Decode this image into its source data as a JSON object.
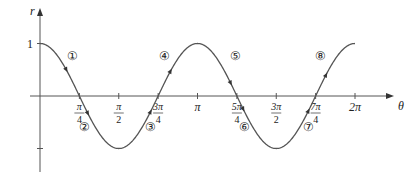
{
  "chart_data": {
    "type": "line",
    "title": "",
    "function": "r = cos(2θ)",
    "xlabel": "θ",
    "ylabel": "r",
    "xlim": [
      0,
      6.2832
    ],
    "ylim": [
      -1,
      1
    ],
    "x_ticks": [
      {
        "value": 0.7854,
        "num": "π",
        "den": "4"
      },
      {
        "value": 1.5708,
        "num": "π",
        "den": "2"
      },
      {
        "value": 2.3562,
        "num": "3π",
        "den": "4"
      },
      {
        "value": 3.1416,
        "label": "π"
      },
      {
        "value": 3.927,
        "num": "5π",
        "den": "4"
      },
      {
        "value": 4.7124,
        "num": "3π",
        "den": "2"
      },
      {
        "value": 5.4978,
        "num": "7π",
        "den": "4"
      },
      {
        "value": 6.2832,
        "label": "2π"
      }
    ],
    "y_ticks": [
      {
        "value": 1,
        "label": "1"
      },
      {
        "value": -1,
        "label": ""
      }
    ],
    "x": [
      0,
      0.7854,
      1.5708,
      2.3562,
      3.1416,
      3.927,
      4.7124,
      5.4978,
      6.2832
    ],
    "series": [
      {
        "name": "cos(2θ)",
        "values": [
          1,
          0,
          -1,
          0,
          1,
          0,
          -1,
          0,
          1
        ],
        "color": "#555555"
      }
    ],
    "annotations": [
      {
        "label": "①",
        "theta": 0.52,
        "r": 0.72
      },
      {
        "label": "②",
        "theta": 0.95,
        "r": -0.42
      },
      {
        "label": "③",
        "theta": 2.2,
        "r": -0.42
      },
      {
        "label": "④",
        "theta": 2.6,
        "r": 0.72
      },
      {
        "label": "⑤",
        "theta": 3.8,
        "r": 0.72
      },
      {
        "label": "⑥",
        "theta": 4.05,
        "r": -0.42
      },
      {
        "label": "⑦",
        "theta": 5.35,
        "r": -0.42
      },
      {
        "label": "⑧",
        "theta": 5.7,
        "r": 0.72
      }
    ],
    "grid": false,
    "legend": null
  }
}
